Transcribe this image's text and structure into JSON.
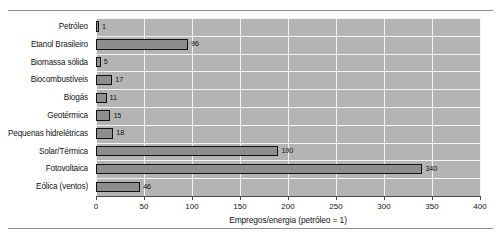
{
  "chart_data": {
    "type": "bar",
    "orientation": "horizontal",
    "title": "",
    "xlabel": "Empregos/energia (petróleo = 1)",
    "ylabel": "",
    "xlim": [
      0,
      400
    ],
    "xticks": [
      0,
      50,
      100,
      150,
      200,
      250,
      300,
      350,
      400
    ],
    "grid": true,
    "legend": false,
    "categories": [
      "Petróleo",
      "Etanol Brasileiro",
      "Biomassa sólida",
      "Biocombustíveis",
      "Biogás",
      "Geotérmica",
      "Pequenas hidrelétricas",
      "Solar/Térmica",
      "Fotovoltaica",
      "Eólica (ventos)"
    ],
    "values": [
      1,
      96,
      5,
      17,
      11,
      15,
      18,
      190,
      340,
      46
    ],
    "data_labels": [
      "1",
      "96",
      "5",
      "17",
      "11",
      "15",
      "18",
      "190",
      "340",
      "46"
    ],
    "colors": {
      "plot_background": "#b4b4b4",
      "gridline": "#f2f2f2",
      "bar_fill": "#8d8d8d",
      "bar_border": "#111111",
      "axis": "#4a4a4a",
      "text": "#141414"
    }
  }
}
